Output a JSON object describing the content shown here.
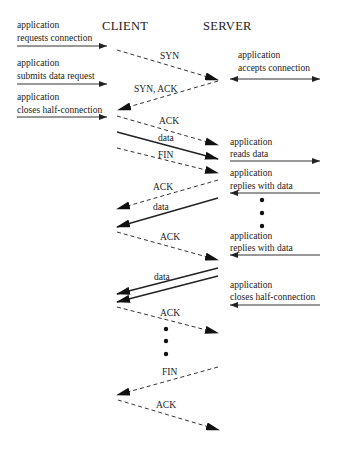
{
  "diagram": {
    "type": "sequence-diagram",
    "headers": {
      "client": "CLIENT",
      "server": "SERVER"
    },
    "client_events": [
      {
        "line1": "application",
        "line2": "requests connection"
      },
      {
        "line1": "application",
        "line2": "submits data request"
      },
      {
        "line1": "application",
        "line2": "closes half-connection"
      }
    ],
    "server_events": [
      {
        "line1": "application",
        "line2": "accepts connection"
      },
      {
        "line1": "application",
        "line2": "reads data"
      },
      {
        "line1": "application",
        "line2": "replies with data"
      },
      {
        "line1": "application",
        "line2": "replies with data"
      },
      {
        "line1": "application",
        "line2": "closes half-connection"
      }
    ],
    "messages": [
      {
        "label": "SYN",
        "direction": "client-to-server",
        "style": "dashed"
      },
      {
        "label": "SYN, ACK",
        "direction": "server-to-client",
        "style": "dashed"
      },
      {
        "label": "ACK",
        "direction": "client-to-server",
        "style": "dashed"
      },
      {
        "label": "data",
        "direction": "client-to-server",
        "style": "solid"
      },
      {
        "label": "FIN",
        "direction": "client-to-server",
        "style": "dashed"
      },
      {
        "label": "ACK",
        "direction": "server-to-client",
        "style": "dashed"
      },
      {
        "label": "data",
        "direction": "server-to-client",
        "style": "solid"
      },
      {
        "label": "ACK",
        "direction": "client-to-server",
        "style": "dashed"
      },
      {
        "label": "data",
        "direction": "server-to-client",
        "style": "solid-double"
      },
      {
        "label": "ACK",
        "direction": "client-to-server",
        "style": "dashed"
      },
      {
        "label": "FIN",
        "direction": "server-to-client",
        "style": "dashed"
      },
      {
        "label": "ACK",
        "direction": "client-to-server",
        "style": "dashed"
      }
    ],
    "ellipsis_symbol": "•"
  }
}
